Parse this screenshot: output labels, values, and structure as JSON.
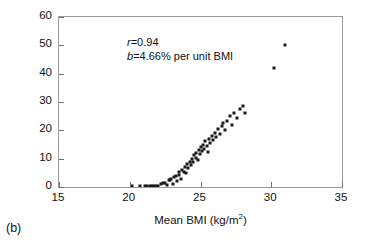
{
  "figure": {
    "panel_label": "(b)"
  },
  "chart_data": {
    "type": "scatter",
    "title": "",
    "xlabel": "Mean BMI (kg/m",
    "xlabel_sup": "2",
    "xlabel_suffix": ")",
    "xlabel_full": "Mean BMI (kg/m2)",
    "ylabel": "Prevalence (%) of overweight",
    "xlim": [
      15,
      35
    ],
    "ylim": [
      0,
      60
    ],
    "xticks": [
      15,
      20,
      25,
      30,
      35
    ],
    "yticks": [
      0,
      10,
      20,
      30,
      40,
      50,
      60
    ],
    "xtick_labels": [
      "15",
      "20",
      "25",
      "30",
      "35"
    ],
    "ytick_labels": [
      "0",
      "10",
      "20",
      "30",
      "40",
      "50",
      "60"
    ],
    "grid": false,
    "legend": false,
    "marker": "square",
    "marker_color": "#1a1a1a",
    "annotations": [
      {
        "symbol": "r",
        "text": "=0.94"
      },
      {
        "symbol": "b",
        "text": "=4.66% per unit BMI"
      }
    ],
    "points": [
      [
        20.15,
        0.4
      ],
      [
        20.75,
        0.3
      ],
      [
        21.05,
        0.5
      ],
      [
        21.25,
        0.2
      ],
      [
        21.4,
        0.3
      ],
      [
        21.55,
        0.2
      ],
      [
        21.7,
        0.4
      ],
      [
        21.85,
        0.2
      ],
      [
        22.0,
        0.3
      ],
      [
        22.2,
        1.2
      ],
      [
        22.35,
        1.5
      ],
      [
        22.5,
        1.3
      ],
      [
        22.6,
        0.6
      ],
      [
        22.75,
        2.6
      ],
      [
        22.85,
        2.4
      ],
      [
        22.95,
        2.8
      ],
      [
        23.05,
        1.2
      ],
      [
        23.15,
        3.6
      ],
      [
        23.25,
        4.0
      ],
      [
        23.35,
        2.0
      ],
      [
        23.45,
        5.2
      ],
      [
        23.5,
        4.4
      ],
      [
        23.6,
        3.0
      ],
      [
        23.7,
        6.0
      ],
      [
        23.8,
        5.4
      ],
      [
        23.9,
        7.0
      ],
      [
        23.95,
        4.8
      ],
      [
        24.05,
        8.0
      ],
      [
        24.15,
        6.6
      ],
      [
        24.25,
        9.0
      ],
      [
        24.3,
        7.6
      ],
      [
        24.4,
        10.0
      ],
      [
        24.5,
        8.8
      ],
      [
        24.55,
        11.2
      ],
      [
        24.65,
        10.4
      ],
      [
        24.7,
        12.0
      ],
      [
        24.8,
        9.6
      ],
      [
        24.9,
        13.0
      ],
      [
        24.95,
        11.6
      ],
      [
        25.05,
        14.0
      ],
      [
        25.1,
        12.6
      ],
      [
        25.2,
        15.0
      ],
      [
        25.25,
        13.4
      ],
      [
        25.35,
        16.2
      ],
      [
        25.45,
        14.6
      ],
      [
        25.5,
        12.2
      ],
      [
        25.6,
        17.0
      ],
      [
        25.7,
        15.4
      ],
      [
        25.8,
        18.0
      ],
      [
        25.9,
        16.6
      ],
      [
        26.0,
        19.2
      ],
      [
        26.1,
        17.6
      ],
      [
        26.25,
        20.4
      ],
      [
        26.4,
        18.8
      ],
      [
        26.5,
        21.6
      ],
      [
        26.6,
        22.6
      ],
      [
        26.75,
        20.0
      ],
      [
        26.9,
        23.4
      ],
      [
        27.05,
        25.0
      ],
      [
        27.2,
        22.0
      ],
      [
        27.4,
        26.2
      ],
      [
        27.6,
        24.4
      ],
      [
        27.8,
        27.4
      ],
      [
        28.0,
        28.6
      ],
      [
        28.15,
        26.0
      ],
      [
        30.2,
        42.0
      ],
      [
        31.0,
        50.2
      ]
    ]
  }
}
